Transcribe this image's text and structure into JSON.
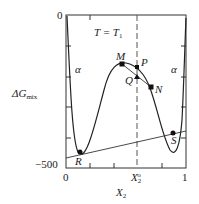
{
  "diagram": {
    "condition_label": "T = T",
    "condition_sub": "1",
    "y_axis": {
      "label": "ΔG",
      "label_sub": "mix",
      "top_tick": "0",
      "bottom_tick": "−500"
    },
    "x_axis": {
      "label": "X",
      "label_sub": "2",
      "ticks": [
        "0",
        "X",
        "1"
      ],
      "mid_tick_sub": "2",
      "mid_tick_sup": "o"
    },
    "phase_labels": [
      "α",
      "α"
    ],
    "points": [
      "M",
      "P",
      "Q",
      "N",
      "R",
      "S"
    ]
  }
}
